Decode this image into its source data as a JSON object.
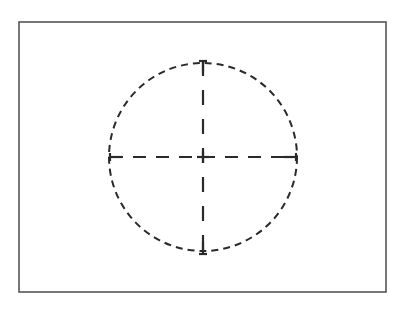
{
  "diagram": {
    "colors": {
      "background": "#ffffff",
      "frame_stroke": "#555555",
      "line_stroke": "#2a2a2a"
    },
    "frame": {
      "x": 19,
      "y": 22,
      "width": 367,
      "height": 270
    },
    "circle": {
      "cx": 203,
      "cy": 157,
      "r": 94,
      "dash": "7 5"
    },
    "horizontal_diameter": {
      "x1": 110,
      "x2": 296,
      "y": 157,
      "dash": "13 10"
    },
    "vertical_diameter": {
      "x": 203,
      "y1": 61,
      "y2": 254,
      "dash": "15 14"
    },
    "center_mark": {
      "x": 203,
      "y": 157,
      "size": 6
    },
    "end_caps": [
      {
        "position": "top",
        "x": 203,
        "y": 61
      },
      {
        "position": "bottom",
        "x": 203,
        "y": 254
      },
      {
        "position": "left",
        "x": 110,
        "y": 157
      },
      {
        "position": "right",
        "x": 296,
        "y": 157
      }
    ]
  }
}
